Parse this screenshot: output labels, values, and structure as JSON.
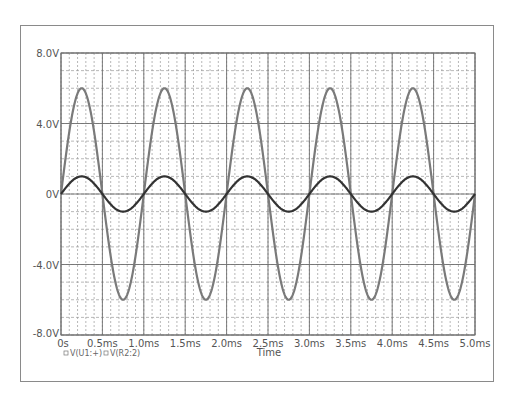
{
  "chart_data": {
    "type": "line",
    "title": "",
    "xlabel": "Time",
    "ylabel": "",
    "xlim": [
      0,
      5.0
    ],
    "ylim": [
      -8.0,
      8.0
    ],
    "x_unit": "ms",
    "x_ticks": [
      "0s",
      "0.5ms",
      "1.0ms",
      "1.5ms",
      "2.0ms",
      "2.5ms",
      "3.0ms",
      "3.5ms",
      "4.0ms",
      "4.5ms",
      "5.0ms"
    ],
    "y_ticks": [
      "8.0V",
      "4.0V",
      "0V",
      "-4.0V",
      "-8.0V"
    ],
    "grid": {
      "major_x_ms": 0.5,
      "minor_x_ms": 0.1,
      "major_y_v": 4.0,
      "minor_y_v": 1.0
    },
    "legend_position": "bottom-left",
    "series": [
      {
        "name": "V(U1:+)",
        "waveform": "sine",
        "amplitude_v": 1.0,
        "frequency_khz": 1.0,
        "phase_deg": 0,
        "color": "#333333"
      },
      {
        "name": "V(R2:2)",
        "waveform": "sine",
        "amplitude_v": 6.0,
        "frequency_khz": 1.0,
        "phase_deg": 0,
        "color": "#7a7a7a"
      }
    ]
  },
  "legend": {
    "item_1": "V(U1:+)",
    "item_2": "V(R2:2)"
  },
  "axis": {
    "xlabel": "Time"
  }
}
